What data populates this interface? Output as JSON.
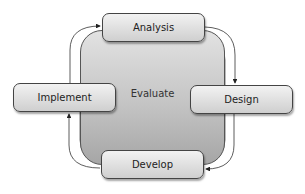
{
  "diagram": {
    "type": "cycle",
    "center": {
      "label": "Evaluate"
    },
    "nodes": [
      {
        "id": "analysis",
        "label": "Analysis"
      },
      {
        "id": "design",
        "label": "Design"
      },
      {
        "id": "develop",
        "label": "Develop"
      },
      {
        "id": "implement",
        "label": "Implement"
      }
    ],
    "edges": [
      {
        "from": "Analysis",
        "to": "Design"
      },
      {
        "from": "Design",
        "to": "Develop"
      },
      {
        "from": "Develop",
        "to": "Implement"
      },
      {
        "from": "Implement",
        "to": "Analysis"
      }
    ],
    "colors": {
      "node_fill_top": "#f2f2f2",
      "node_fill_bottom": "#cfcfcf",
      "center_fill_top": "#e2e2e2",
      "center_fill_bottom": "#a6a6a6",
      "stroke": "#444444"
    }
  }
}
